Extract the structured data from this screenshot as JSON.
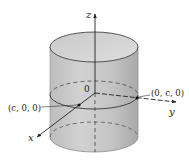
{
  "figure": {
    "axes": {
      "z": {
        "label": "z"
      },
      "x": {
        "label": "x"
      },
      "y": {
        "label": "y"
      }
    },
    "origin_label": "0",
    "points": [
      {
        "id": "x-intercept",
        "label": "(c, 0, 0)"
      },
      {
        "id": "y-intercept",
        "label": "(0, c, 0)"
      }
    ],
    "colors": {
      "cylinder_fill": "#c8c8c8",
      "cylinder_top": "#d6d6d6",
      "stroke": "#333333"
    }
  }
}
